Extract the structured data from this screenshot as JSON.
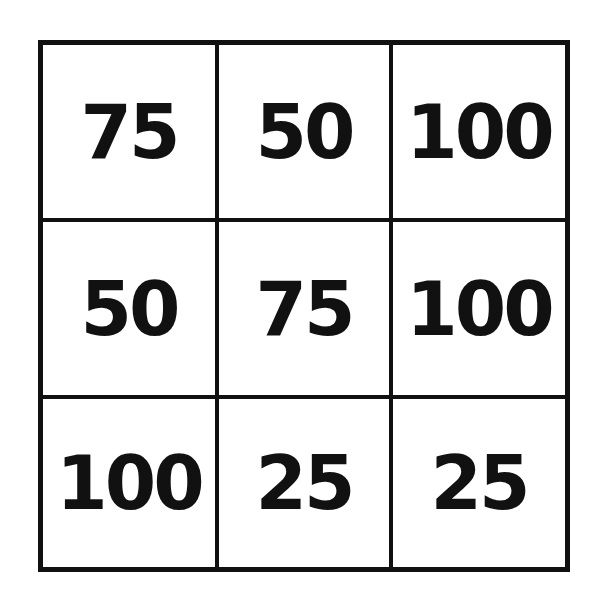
{
  "grid": {
    "rows": 3,
    "cols": 3,
    "cells": [
      [
        "75",
        "50",
        "100"
      ],
      [
        "50",
        "75",
        "100"
      ],
      [
        "100",
        "25",
        "25"
      ]
    ]
  }
}
